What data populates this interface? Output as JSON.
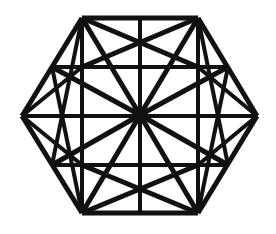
{
  "figure": {
    "title": "Hexagonal Star Grid Line Drawing",
    "type": "line-diagram",
    "shape_name": "hexagon",
    "background_color": "#ffffff",
    "line_color": "#111111",
    "canvas": {
      "width": 276,
      "height": 234
    },
    "center": {
      "x": 140,
      "y": 115
    },
    "spoke_count": 12,
    "vertices": [
      {
        "name": "left",
        "x": 22,
        "y": 116
      },
      {
        "name": "top-left",
        "x": 82,
        "y": 18
      },
      {
        "name": "top-right",
        "x": 198,
        "y": 18
      },
      {
        "name": "right",
        "x": 257,
        "y": 116
      },
      {
        "name": "bottom-right",
        "x": 198,
        "y": 213
      },
      {
        "name": "bottom-left",
        "x": 82,
        "y": 213
      }
    ],
    "edge_midpoints": [
      {
        "name": "mid-top-left-edge",
        "x": 52,
        "y": 67
      },
      {
        "name": "mid-top-edge",
        "x": 140,
        "y": 18
      },
      {
        "name": "mid-top-right-edge",
        "x": 228,
        "y": 67
      },
      {
        "name": "mid-bottom-right-edge",
        "x": 228,
        "y": 165
      },
      {
        "name": "mid-bottom-edge",
        "x": 140,
        "y": 213
      },
      {
        "name": "mid-bottom-left-edge",
        "x": 52,
        "y": 165
      }
    ],
    "inner_nodes": [
      {
        "name": "inner-upper-left",
        "x": 82,
        "y": 67
      },
      {
        "name": "inner-upper-right",
        "x": 198,
        "y": 67
      },
      {
        "name": "inner-lower-right",
        "x": 198,
        "y": 165
      },
      {
        "name": "inner-lower-left",
        "x": 82,
        "y": 165
      }
    ],
    "segments": [
      {
        "name": "hex-edge-top",
        "x1": 82,
        "y1": 18,
        "x2": 198,
        "y2": 18,
        "w": 5
      },
      {
        "name": "hex-edge-upper-right",
        "x1": 198,
        "y1": 18,
        "x2": 257,
        "y2": 116,
        "w": 5
      },
      {
        "name": "hex-edge-lower-right",
        "x1": 257,
        "y1": 116,
        "x2": 198,
        "y2": 213,
        "w": 5
      },
      {
        "name": "hex-edge-bottom",
        "x1": 198,
        "y1": 213,
        "x2": 82,
        "y2": 213,
        "w": 5
      },
      {
        "name": "hex-edge-lower-left",
        "x1": 82,
        "y1": 213,
        "x2": 22,
        "y2": 116,
        "w": 5
      },
      {
        "name": "hex-edge-upper-left",
        "x1": 22,
        "y1": 116,
        "x2": 82,
        "y2": 18,
        "w": 5
      },
      {
        "name": "grid-vertical-left",
        "x1": 82,
        "y1": 18,
        "x2": 82,
        "y2": 213,
        "w": 4
      },
      {
        "name": "grid-vertical-center",
        "x1": 140,
        "y1": 18,
        "x2": 140,
        "y2": 213,
        "w": 4
      },
      {
        "name": "grid-vertical-right",
        "x1": 198,
        "y1": 18,
        "x2": 198,
        "y2": 213,
        "w": 4
      },
      {
        "name": "grid-horizontal-upper",
        "x1": 52,
        "y1": 67,
        "x2": 228,
        "y2": 67,
        "w": 4
      },
      {
        "name": "grid-horizontal-middle",
        "x1": 22,
        "y1": 116,
        "x2": 257,
        "y2": 116,
        "w": 4
      },
      {
        "name": "grid-horizontal-lower",
        "x1": 52,
        "y1": 165,
        "x2": 228,
        "y2": 165,
        "w": 4
      },
      {
        "name": "spoke-center-to-top-left-vertex",
        "x1": 140,
        "y1": 115,
        "x2": 82,
        "y2": 18,
        "w": 5
      },
      {
        "name": "spoke-center-to-top-right-vertex",
        "x1": 140,
        "y1": 115,
        "x2": 198,
        "y2": 18,
        "w": 5
      },
      {
        "name": "spoke-center-to-bottom-right-vertex",
        "x1": 140,
        "y1": 115,
        "x2": 198,
        "y2": 213,
        "w": 5
      },
      {
        "name": "spoke-center-to-bottom-left-vertex",
        "x1": 140,
        "y1": 115,
        "x2": 82,
        "y2": 213,
        "w": 5
      },
      {
        "name": "spoke-center-to-mid-top-left-edge",
        "x1": 140,
        "y1": 115,
        "x2": 52,
        "y2": 67,
        "w": 5
      },
      {
        "name": "spoke-center-to-mid-top-right-edge",
        "x1": 140,
        "y1": 115,
        "x2": 228,
        "y2": 67,
        "w": 5
      },
      {
        "name": "spoke-center-to-mid-bottom-right-edge",
        "x1": 140,
        "y1": 115,
        "x2": 228,
        "y2": 165,
        "w": 5
      },
      {
        "name": "spoke-center-to-mid-bottom-left-edge",
        "x1": 140,
        "y1": 115,
        "x2": 52,
        "y2": 165,
        "w": 5
      },
      {
        "name": "diagonal-topleft-to-inner-upper-right",
        "x1": 82,
        "y1": 18,
        "x2": 198,
        "y2": 67,
        "w": 5
      },
      {
        "name": "diagonal-topright-to-inner-upper-left",
        "x1": 198,
        "y1": 18,
        "x2": 82,
        "y2": 67,
        "w": 5
      },
      {
        "name": "diagonal-botleft-to-inner-lower-right",
        "x1": 82,
        "y1": 213,
        "x2": 198,
        "y2": 165,
        "w": 5
      },
      {
        "name": "diagonal-botright-to-inner-lower-left",
        "x1": 198,
        "y1": 213,
        "x2": 82,
        "y2": 165,
        "w": 5
      },
      {
        "name": "diagonal-topleft-to-mid-bottom-left",
        "x1": 82,
        "y1": 18,
        "x2": 52,
        "y2": 165,
        "w": 4
      },
      {
        "name": "diagonal-topright-to-mid-bottom-right",
        "x1": 198,
        "y1": 18,
        "x2": 228,
        "y2": 165,
        "w": 4
      },
      {
        "name": "diagonal-botleft-to-mid-top-left",
        "x1": 82,
        "y1": 213,
        "x2": 52,
        "y2": 67,
        "w": 4
      },
      {
        "name": "diagonal-botright-to-mid-top-right",
        "x1": 198,
        "y1": 213,
        "x2": 228,
        "y2": 67,
        "w": 4
      },
      {
        "name": "chord-left-vertex-to-inner-upper-left",
        "x1": 22,
        "y1": 116,
        "x2": 82,
        "y2": 67,
        "w": 4
      },
      {
        "name": "chord-left-vertex-to-inner-lower-left",
        "x1": 22,
        "y1": 116,
        "x2": 82,
        "y2": 165,
        "w": 4
      },
      {
        "name": "chord-right-vertex-to-inner-upper-right",
        "x1": 257,
        "y1": 116,
        "x2": 198,
        "y2": 67,
        "w": 4
      },
      {
        "name": "chord-right-vertex-to-inner-lower-right",
        "x1": 257,
        "y1": 116,
        "x2": 198,
        "y2": 165,
        "w": 4
      },
      {
        "name": "chord-mid-top-to-inner-lower-left",
        "x1": 140,
        "y1": 18,
        "x2": 82,
        "y2": 165,
        "w": 0
      },
      {
        "name": "chord-mid-bottom-to-inner-upper-left",
        "x1": 140,
        "y1": 213,
        "x2": 82,
        "y2": 67,
        "w": 0
      }
    ]
  }
}
